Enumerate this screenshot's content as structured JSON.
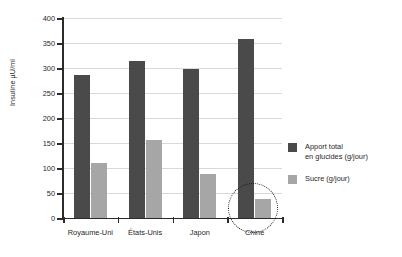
{
  "chart_data": {
    "type": "bar",
    "title": "",
    "xlabel": "",
    "ylabel": "Insuline µU/ml",
    "ylim": [
      0,
      400
    ],
    "ytick_labels": [
      "400",
      "350",
      "300",
      "250",
      "200",
      "150",
      "100",
      "50",
      "0"
    ],
    "ytick_values": [
      400,
      350,
      300,
      250,
      200,
      150,
      100,
      50,
      0
    ],
    "grid": true,
    "legend_position": "right",
    "categories": [
      "Royaume-Uni",
      "États-Unis",
      "Japon",
      "Chine"
    ],
    "series": [
      {
        "name": "Apport total en glucides (g/jour)",
        "color": "#4a4a4a",
        "values": [
          287,
          315,
          298,
          358
        ]
      },
      {
        "name": "Sucre (g/jour)",
        "color": "#a6a6a6",
        "values": [
          110,
          157,
          88,
          38
        ]
      }
    ],
    "annotations": [
      {
        "type": "dotted-circle",
        "target": "Chine sucre bar",
        "shape": "ellipse"
      }
    ]
  },
  "legend": {
    "entries": [
      {
        "line1": "Apport total",
        "line2": "en glucides (g/jour)",
        "color": "#4a4a4a"
      },
      {
        "line1": "Sucre (g/jour)",
        "line2": "",
        "color": "#a6a6a6"
      }
    ]
  }
}
